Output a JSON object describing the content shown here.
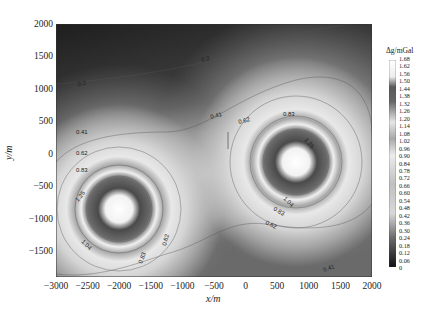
{
  "chart_data": {
    "type": "heatmap",
    "title": "",
    "xlabel": "x/m",
    "ylabel": "y/m",
    "xlim": [
      -3000,
      2000
    ],
    "ylim": [
      -1900,
      2000
    ],
    "x_ticks": [
      "-3000",
      "-2500",
      "-2000",
      "-1500",
      "-1000",
      "-500",
      "0",
      "500",
      "1000",
      "1500",
      "2000"
    ],
    "y_ticks": [
      "2000",
      "1500",
      "1000",
      "500",
      "0",
      "-500",
      "-1000",
      "-1500"
    ],
    "colorbar": {
      "title": "Δg/mGal",
      "colormap": "grayscale (banded)",
      "ticks": [
        "1.68",
        "1.62",
        "1.56",
        "1.50",
        "1.44",
        "1.38",
        "1.32",
        "1.26",
        "1.20",
        "1.14",
        "1.08",
        "1.02",
        "0.96",
        "0.90",
        "0.84",
        "0.78",
        "0.72",
        "0.66",
        "0.60",
        "0.54",
        "0.48",
        "0.42",
        "0.36",
        "0.30",
        "0.24",
        "0.18",
        "0.12",
        "0.06",
        "0"
      ],
      "min": 0,
      "max": 1.68
    },
    "anomaly_sources": [
      {
        "x": -2000,
        "y": -1000,
        "peak": 1.68
      },
      {
        "x": 800,
        "y": -200,
        "peak": 1.68
      }
    ],
    "contour_levels": [
      "0.2",
      "0.41",
      "0.62",
      "0.83",
      "1.04",
      "1.25"
    ],
    "contour_labels": [
      {
        "text": "0.2",
        "x": -2600,
        "y": 900
      },
      {
        "text": "0.2",
        "x": -200,
        "y": 1350
      },
      {
        "text": "0.41",
        "x": -2700,
        "y": 250
      },
      {
        "text": "0.62",
        "x": -2700,
        "y": -10
      },
      {
        "text": "0.83",
        "x": -2700,
        "y": -230
      },
      {
        "text": "1.25",
        "x": -2600,
        "y": -600
      },
      {
        "text": "1.04",
        "x": -2600,
        "y": -1250
      },
      {
        "text": "0.83",
        "x": -1600,
        "y": -1180
      },
      {
        "text": "0.62",
        "x": -1300,
        "y": -800
      },
      {
        "text": "0.41",
        "x": -650,
        "y": 480
      },
      {
        "text": "0.62",
        "x": -200,
        "y": 380
      },
      {
        "text": "0.83",
        "x": 500,
        "y": 300
      },
      {
        "text": "1.25",
        "x": 1200,
        "y": 100
      },
      {
        "text": "1.04",
        "x": 300,
        "y": -650
      },
      {
        "text": "0.83",
        "x": 200,
        "y": -850
      },
      {
        "text": "0.62",
        "x": 0,
        "y": -1050
      },
      {
        "text": "0.41",
        "x": 1400,
        "y": -1330
      }
    ]
  }
}
